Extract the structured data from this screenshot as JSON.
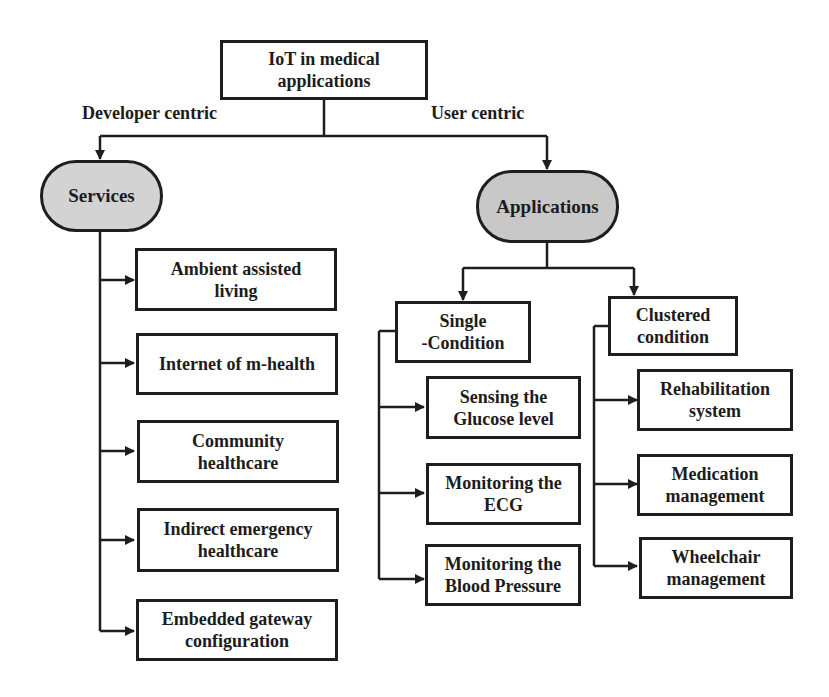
{
  "diagram": {
    "title": "IoT in medical applications",
    "root": {
      "line1": "IoT in medical",
      "line2": "applications"
    },
    "branches": {
      "left_label": "Developer centric",
      "right_label": "User centric"
    },
    "services": {
      "label": "Services",
      "fill": "#d3d3d3",
      "items": [
        {
          "line1": "Ambient assisted",
          "line2": "living"
        },
        {
          "line1": "Internet of m-health",
          "line2": ""
        },
        {
          "line1": "Community",
          "line2": "healthcare"
        },
        {
          "line1": "Indirect emergency",
          "line2": "healthcare"
        },
        {
          "line1": "Embedded gateway",
          "line2": "configuration"
        }
      ]
    },
    "applications": {
      "label": "Applications",
      "fill": "#c8c8c8",
      "single_condition": {
        "line1": "Single",
        "line2": "-Condition",
        "items": [
          {
            "line1": "Sensing the",
            "line2": "Glucose level"
          },
          {
            "line1": "Monitoring the",
            "line2": "ECG"
          },
          {
            "line1": "Monitoring the",
            "line2": "Blood Pressure"
          }
        ]
      },
      "clustered_condition": {
        "line1": "Clustered",
        "line2": "condition",
        "items": [
          {
            "line1": "Rehabilitation",
            "line2": "system"
          },
          {
            "line1": "Medication",
            "line2": "management"
          },
          {
            "line1": "Wheelchair",
            "line2": "management"
          }
        ]
      }
    }
  }
}
